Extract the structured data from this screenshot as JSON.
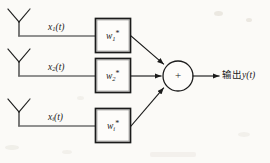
{
  "figure": {
    "type": "block-diagram",
    "background_color": "#fbfaf7",
    "stroke_color": "#1b1b1b"
  },
  "branches": [
    {
      "index": 1,
      "antenna_name": "antenna-element-1",
      "signal_label": "x",
      "signal_sub": "1",
      "signal_arg": "(t)",
      "weight_label": "w",
      "weight_sub": "1",
      "weight_sup": "*"
    },
    {
      "index": 2,
      "antenna_name": "antenna-element-2",
      "signal_label": "x",
      "signal_sub": "2",
      "signal_arg": "(t)",
      "weight_label": "w",
      "weight_sub": "2",
      "weight_sup": "*"
    },
    {
      "index": 3,
      "antenna_name": "antenna-element-i",
      "signal_label": "x",
      "signal_sub": "i",
      "signal_arg": "(t)",
      "weight_label": "w",
      "weight_sub": "i",
      "weight_sup": "*"
    }
  ],
  "summing_node": {
    "symbol": "+",
    "name": "summing-junction"
  },
  "output": {
    "prefix": "输出",
    "variable": "y",
    "arg": "(t)",
    "full_text": "输出y(t)"
  }
}
